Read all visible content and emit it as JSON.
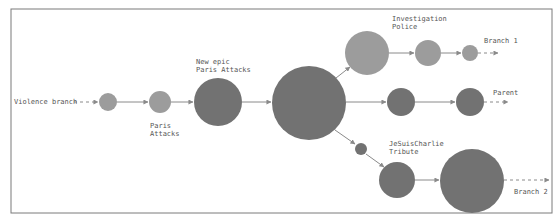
{
  "diagram": {
    "type": "branch-flow",
    "colors": {
      "light_node": "#9c9c9c",
      "dark_node": "#727272",
      "edge": "#8a8a8a",
      "border": "#7a7a7a",
      "text": "#555555"
    },
    "labels": {
      "violence_branch": "Violence branch",
      "paris_attacks_line1": "Paris",
      "paris_attacks_line2": "Attacks",
      "new_epic_line1": "New epic",
      "new_epic_line2": "Paris Attacks",
      "investigation_line1": "Investigation",
      "investigation_line2": "Police",
      "branch1": "Branch 1",
      "parent": "Parent",
      "jesuischarlie_line1": "JeSuisCharlie",
      "jesuischarlie_line2": "Tribute",
      "branch2": "Branch 2"
    },
    "nodes": [
      {
        "id": "n1",
        "cx": 108,
        "cy": 102,
        "r": 9,
        "shade": "light"
      },
      {
        "id": "n2",
        "cx": 160,
        "cy": 102,
        "r": 11,
        "shade": "light"
      },
      {
        "id": "n3",
        "cx": 218,
        "cy": 102,
        "r": 24,
        "shade": "dark",
        "label": "New epic Paris Attacks"
      },
      {
        "id": "n4",
        "cx": 309,
        "cy": 103,
        "r": 37,
        "shade": "dark"
      },
      {
        "id": "n5",
        "cx": 367,
        "cy": 53,
        "r": 22,
        "shade": "light",
        "label": "Investigation Police"
      },
      {
        "id": "n6",
        "cx": 428,
        "cy": 53,
        "r": 13,
        "shade": "light"
      },
      {
        "id": "n7",
        "cx": 470,
        "cy": 52,
        "r": 8,
        "shade": "light",
        "label": "Branch 1"
      },
      {
        "id": "n8",
        "cx": 401,
        "cy": 102,
        "r": 14,
        "shade": "dark"
      },
      {
        "id": "n9",
        "cx": 470,
        "cy": 102,
        "r": 14,
        "shade": "dark",
        "label": "Parent"
      },
      {
        "id": "n10",
        "cx": 361,
        "cy": 149,
        "r": 6,
        "shade": "dark"
      },
      {
        "id": "n11",
        "cx": 397,
        "cy": 180,
        "r": 18,
        "shade": "dark",
        "label": "JeSuisCharlie Tribute"
      },
      {
        "id": "n12",
        "cx": 472,
        "cy": 181,
        "r": 32,
        "shade": "dark",
        "label": "Branch 2"
      }
    ],
    "edges": [
      {
        "from": "Violence branch",
        "to": "n1",
        "style": "dashed"
      },
      {
        "from": "n1",
        "to": "n2",
        "style": "solid"
      },
      {
        "from": "n2",
        "to": "n3",
        "style": "solid"
      },
      {
        "from": "n3",
        "to": "n4",
        "style": "solid"
      },
      {
        "from": "n4",
        "to": "n5",
        "style": "solid"
      },
      {
        "from": "n5",
        "to": "n6",
        "style": "solid"
      },
      {
        "from": "n6",
        "to": "n7",
        "style": "solid"
      },
      {
        "from": "n7",
        "to": "Branch 1",
        "style": "dashed"
      },
      {
        "from": "n4",
        "to": "n8",
        "style": "solid"
      },
      {
        "from": "n8",
        "to": "n9",
        "style": "solid"
      },
      {
        "from": "n9",
        "to": "Parent",
        "style": "dashed"
      },
      {
        "from": "n4",
        "to": "n10",
        "style": "solid"
      },
      {
        "from": "n10",
        "to": "n11",
        "style": "solid"
      },
      {
        "from": "n11",
        "to": "n12",
        "style": "solid"
      },
      {
        "from": "n12",
        "to": "Branch 2",
        "style": "dashed"
      }
    ]
  }
}
